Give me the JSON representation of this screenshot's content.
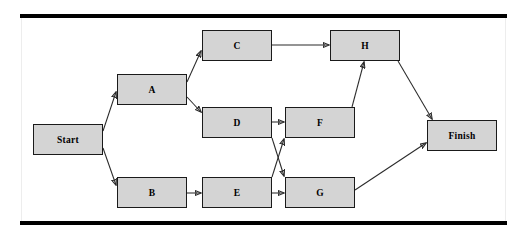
{
  "diagram": {
    "type": "activity-network-diagram",
    "node_fill_color": "#d4d4d4",
    "node_border_color": "#1a1a1a",
    "edge_color": "#2a2a2a",
    "rule_color": "#000000",
    "background_color": "#ffffff",
    "nodes": [
      {
        "id": "start",
        "label": "Start",
        "x": 33,
        "y": 124,
        "w": 70,
        "h": 31
      },
      {
        "id": "a",
        "label": "A",
        "x": 117,
        "y": 74,
        "w": 70,
        "h": 31
      },
      {
        "id": "b",
        "label": "B",
        "x": 117,
        "y": 177,
        "w": 70,
        "h": 31
      },
      {
        "id": "c",
        "label": "C",
        "x": 202,
        "y": 30,
        "w": 70,
        "h": 31
      },
      {
        "id": "d",
        "label": "D",
        "x": 202,
        "y": 107,
        "w": 70,
        "h": 31
      },
      {
        "id": "e",
        "label": "E",
        "x": 202,
        "y": 177,
        "w": 70,
        "h": 31
      },
      {
        "id": "f",
        "label": "F",
        "x": 285,
        "y": 107,
        "w": 70,
        "h": 31
      },
      {
        "id": "g",
        "label": "G",
        "x": 285,
        "y": 177,
        "w": 70,
        "h": 31
      },
      {
        "id": "h",
        "label": "H",
        "x": 330,
        "y": 30,
        "w": 70,
        "h": 31
      },
      {
        "id": "finish",
        "label": "Finish",
        "x": 427,
        "y": 120,
        "w": 70,
        "h": 31
      }
    ],
    "edges": [
      {
        "from": "start",
        "to": "a",
        "x1": 103,
        "y1": 131,
        "x2": 116,
        "y2": 92
      },
      {
        "from": "start",
        "to": "b",
        "x1": 103,
        "y1": 148,
        "x2": 116,
        "y2": 185
      },
      {
        "from": "a",
        "to": "c",
        "x1": 187,
        "y1": 82,
        "x2": 201,
        "y2": 51
      },
      {
        "from": "a",
        "to": "d",
        "x1": 187,
        "y1": 97,
        "x2": 201,
        "y2": 112
      },
      {
        "from": "b",
        "to": "e",
        "x1": 187,
        "y1": 193,
        "x2": 201,
        "y2": 193
      },
      {
        "from": "c",
        "to": "h",
        "x1": 272,
        "y1": 45,
        "x2": 329,
        "y2": 45
      },
      {
        "from": "d",
        "to": "f",
        "x1": 272,
        "y1": 122,
        "x2": 284,
        "y2": 122
      },
      {
        "from": "d",
        "to": "g",
        "x1": 272,
        "y1": 138,
        "x2": 284,
        "y2": 176
      },
      {
        "from": "e",
        "to": "g",
        "x1": 272,
        "y1": 193,
        "x2": 284,
        "y2": 193
      },
      {
        "from": "e",
        "to": "f",
        "x1": 272,
        "y1": 177,
        "x2": 284,
        "y2": 139
      },
      {
        "from": "f",
        "to": "h",
        "x1": 352,
        "y1": 107,
        "x2": 364,
        "y2": 62
      },
      {
        "from": "g",
        "to": "finish",
        "x1": 355,
        "y1": 190,
        "x2": 426,
        "y2": 143
      },
      {
        "from": "h",
        "to": "finish",
        "x1": 398,
        "y1": 61,
        "x2": 432,
        "y2": 119
      }
    ]
  }
}
